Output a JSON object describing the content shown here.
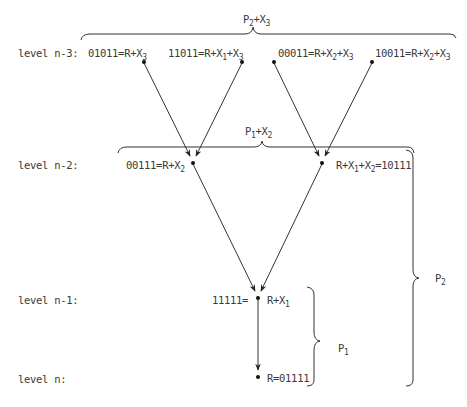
{
  "diagram": {
    "levels": [
      {
        "id": "n-3",
        "label": "level n-3:"
      },
      {
        "id": "n-2",
        "label": "level n-2:"
      },
      {
        "id": "n-1",
        "label": "level n-1:"
      },
      {
        "id": "n",
        "label": "level n:"
      }
    ],
    "nodes": [
      {
        "id": "01011",
        "level": "n-3",
        "code": "01011",
        "expr": [
          "R+X",
          "3"
        ],
        "text": "01011=R+X3"
      },
      {
        "id": "11011",
        "level": "n-3",
        "code": "11011",
        "expr": [
          "R+X",
          "1",
          "+X",
          "3"
        ],
        "text": "11011=R+X1+X3"
      },
      {
        "id": "00011",
        "level": "n-3",
        "code": "00011",
        "expr": [
          "R+X",
          "2",
          "+X",
          "3"
        ],
        "text": "00011=R+X2+X3"
      },
      {
        "id": "10011",
        "level": "n-3",
        "code": "10011",
        "expr": [
          "R+X",
          "2",
          "+X",
          "3"
        ],
        "text": "10011=R+X2+X3"
      },
      {
        "id": "00111",
        "level": "n-2",
        "code": "00111",
        "expr": [
          "R+X",
          "2"
        ],
        "text": "00111=R+X2"
      },
      {
        "id": "10111",
        "level": "n-2",
        "code": "10111",
        "expr": [
          "R+X",
          "1",
          "+X",
          "2"
        ],
        "text": "R+X1+X2=10111"
      },
      {
        "id": "11111",
        "level": "n-1",
        "code": "11111",
        "expr": [
          "R+X",
          "1"
        ],
        "text": "11111= R+X1"
      },
      {
        "id": "01111",
        "level": "n",
        "code": "01111",
        "expr": [
          "R"
        ],
        "text": "R=01111"
      }
    ],
    "edges": [
      {
        "from": "01011",
        "to": "00111"
      },
      {
        "from": "11011",
        "to": "00111"
      },
      {
        "from": "00011",
        "to": "10111"
      },
      {
        "from": "10011",
        "to": "10111"
      },
      {
        "from": "00111",
        "to": "11111"
      },
      {
        "from": "10111",
        "to": "11111"
      },
      {
        "from": "11111",
        "to": "01111"
      }
    ],
    "braces": [
      {
        "id": "top",
        "label": [
          "P",
          "2",
          "+X",
          "3"
        ],
        "orientation": "horizontal"
      },
      {
        "id": "middle",
        "label": [
          "P",
          "1",
          "+X",
          "2"
        ],
        "orientation": "horizontal"
      },
      {
        "id": "p1",
        "label": [
          "P",
          "1"
        ],
        "orientation": "vertical"
      },
      {
        "id": "p2",
        "label": [
          "P",
          "2"
        ],
        "orientation": "vertical"
      }
    ]
  }
}
